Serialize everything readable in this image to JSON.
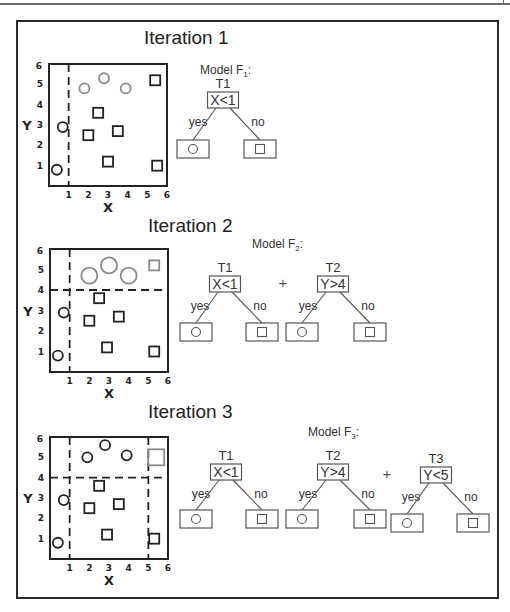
{
  "colors": {
    "ink": "#222222",
    "gray_marker": "#8a8a8a",
    "tree_line": "#555555",
    "frame": "#2a2a2a"
  },
  "iterations": [
    {
      "title": "Iteration 1",
      "model_label": "Model F",
      "model_sub": "1",
      "plot": {
        "xlabel": "X",
        "ylabel": "Y",
        "xticks": [
          "1",
          "2",
          "3",
          "4",
          "5",
          "6"
        ],
        "yticks": [
          "1",
          "2",
          "3",
          "4",
          "5",
          "6"
        ],
        "splits": [
          {
            "axis": "x",
            "value": 1,
            "from": 0,
            "to": 6
          }
        ],
        "points": [
          {
            "shape": "circle",
            "x": 0.4,
            "y": 0.8,
            "tone": "dark",
            "size": "small"
          },
          {
            "shape": "circle",
            "x": 0.7,
            "y": 2.9,
            "tone": "dark",
            "size": "small"
          },
          {
            "shape": "circle",
            "x": 1.8,
            "y": 4.8,
            "tone": "gray",
            "size": "small"
          },
          {
            "shape": "circle",
            "x": 2.8,
            "y": 5.3,
            "tone": "gray",
            "size": "small"
          },
          {
            "shape": "circle",
            "x": 3.9,
            "y": 4.8,
            "tone": "gray",
            "size": "small"
          },
          {
            "shape": "square",
            "x": 5.4,
            "y": 5.2,
            "tone": "dark",
            "size": "small"
          },
          {
            "shape": "square",
            "x": 2.5,
            "y": 3.6,
            "tone": "dark",
            "size": "small"
          },
          {
            "shape": "square",
            "x": 2.0,
            "y": 2.5,
            "tone": "dark",
            "size": "small"
          },
          {
            "shape": "square",
            "x": 3.5,
            "y": 2.7,
            "tone": "dark",
            "size": "small"
          },
          {
            "shape": "square",
            "x": 3.0,
            "y": 1.2,
            "tone": "dark",
            "size": "small"
          },
          {
            "shape": "square",
            "x": 5.5,
            "y": 1.0,
            "tone": "dark",
            "size": "small"
          }
        ]
      },
      "trees": [
        {
          "name": "T1",
          "condition": "X<1",
          "yes_label": "yes",
          "no_label": "no",
          "yes_leaf": "circle",
          "no_leaf": "square",
          "plus_before": false
        }
      ]
    },
    {
      "title": "Iteration 2",
      "model_label": "Model F",
      "model_sub": "2",
      "plot": {
        "xlabel": "X",
        "ylabel": "Y",
        "xticks": [
          "1",
          "2",
          "3",
          "4",
          "5",
          "6"
        ],
        "yticks": [
          "1",
          "2",
          "3",
          "4",
          "5",
          "6"
        ],
        "splits": [
          {
            "axis": "x",
            "value": 1,
            "from": 0,
            "to": 6
          },
          {
            "axis": "y",
            "value": 4,
            "from": 0,
            "to": 6
          }
        ],
        "points": [
          {
            "shape": "circle",
            "x": 0.4,
            "y": 0.8,
            "tone": "dark",
            "size": "small"
          },
          {
            "shape": "circle",
            "x": 0.7,
            "y": 2.9,
            "tone": "dark",
            "size": "small"
          },
          {
            "shape": "circle",
            "x": 2.0,
            "y": 4.7,
            "tone": "gray",
            "size": "large"
          },
          {
            "shape": "circle",
            "x": 3.0,
            "y": 5.2,
            "tone": "gray",
            "size": "large"
          },
          {
            "shape": "circle",
            "x": 4.0,
            "y": 4.7,
            "tone": "gray",
            "size": "large"
          },
          {
            "shape": "square",
            "x": 5.3,
            "y": 5.2,
            "tone": "gray",
            "size": "small"
          },
          {
            "shape": "square",
            "x": 2.5,
            "y": 3.6,
            "tone": "dark",
            "size": "small"
          },
          {
            "shape": "square",
            "x": 2.0,
            "y": 2.5,
            "tone": "dark",
            "size": "small"
          },
          {
            "shape": "square",
            "x": 3.5,
            "y": 2.7,
            "tone": "dark",
            "size": "small"
          },
          {
            "shape": "square",
            "x": 2.9,
            "y": 1.2,
            "tone": "dark",
            "size": "small"
          },
          {
            "shape": "square",
            "x": 5.3,
            "y": 1.0,
            "tone": "dark",
            "size": "small"
          }
        ]
      },
      "trees": [
        {
          "name": "T1",
          "condition": "X<1",
          "yes_label": "yes",
          "no_label": "no",
          "yes_leaf": "circle",
          "no_leaf": "square",
          "plus_before": false
        },
        {
          "name": "T2",
          "condition": "Y>4",
          "yes_label": "yes",
          "no_label": "no",
          "yes_leaf": "circle",
          "no_leaf": "square",
          "plus_before": true
        }
      ]
    },
    {
      "title": "Iteration 3",
      "model_label": "Model F",
      "model_sub": "3",
      "plot": {
        "xlabel": "X",
        "ylabel": "Y",
        "xticks": [
          "1",
          "2",
          "3",
          "4",
          "5",
          "6"
        ],
        "yticks": [
          "1",
          "2",
          "3",
          "4",
          "5",
          "6"
        ],
        "splits": [
          {
            "axis": "x",
            "value": 1,
            "from": 0,
            "to": 6
          },
          {
            "axis": "y",
            "value": 4,
            "from": 0,
            "to": 6
          },
          {
            "axis": "x",
            "value": 5,
            "from": 0,
            "to": 6
          }
        ],
        "points": [
          {
            "shape": "circle",
            "x": 0.4,
            "y": 0.8,
            "tone": "dark",
            "size": "small"
          },
          {
            "shape": "circle",
            "x": 0.7,
            "y": 2.9,
            "tone": "dark",
            "size": "small"
          },
          {
            "shape": "circle",
            "x": 1.9,
            "y": 5.0,
            "tone": "dark",
            "size": "small"
          },
          {
            "shape": "circle",
            "x": 2.8,
            "y": 5.6,
            "tone": "dark",
            "size": "small"
          },
          {
            "shape": "circle",
            "x": 3.9,
            "y": 5.1,
            "tone": "dark",
            "size": "small"
          },
          {
            "shape": "square",
            "x": 5.4,
            "y": 5.0,
            "tone": "gray",
            "size": "large"
          },
          {
            "shape": "square",
            "x": 2.5,
            "y": 3.6,
            "tone": "dark",
            "size": "small"
          },
          {
            "shape": "square",
            "x": 2.0,
            "y": 2.5,
            "tone": "dark",
            "size": "small"
          },
          {
            "shape": "square",
            "x": 3.5,
            "y": 2.7,
            "tone": "dark",
            "size": "small"
          },
          {
            "shape": "square",
            "x": 2.9,
            "y": 1.2,
            "tone": "dark",
            "size": "small"
          },
          {
            "shape": "square",
            "x": 5.3,
            "y": 1.0,
            "tone": "dark",
            "size": "small"
          }
        ]
      },
      "trees": [
        {
          "name": "T1",
          "condition": "X<1",
          "yes_label": "yes",
          "no_label": "no",
          "yes_leaf": "circle",
          "no_leaf": "square",
          "plus_before": false
        },
        {
          "name": "T2",
          "condition": "Y>4",
          "yes_label": "yes",
          "no_label": "no",
          "yes_leaf": "circle",
          "no_leaf": "square",
          "plus_before": false
        },
        {
          "name": "T3",
          "condition": "Y<5",
          "yes_label": "yes",
          "no_label": "no",
          "yes_leaf": "circle",
          "no_leaf": "square",
          "plus_before": true
        }
      ]
    }
  ]
}
